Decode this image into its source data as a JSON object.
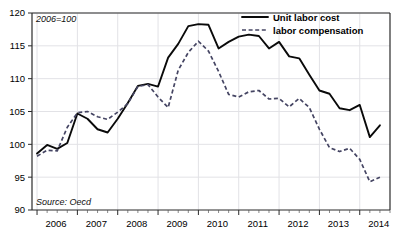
{
  "chart_data": {
    "type": "line",
    "title": "",
    "subtitle": "",
    "annotation_index": "2006=100",
    "source_note": "Source: Oecd",
    "xlabel": "",
    "ylabel": "",
    "ylim": [
      90,
      120
    ],
    "yticks": [
      90,
      95,
      100,
      105,
      110,
      115,
      120
    ],
    "ytick_labels": [
      "90",
      "95",
      "100",
      "105",
      "110",
      "115",
      "120"
    ],
    "xlim": [
      2005.875,
      2014.75
    ],
    "xticks": [
      2006,
      2007,
      2008,
      2009,
      2010,
      2011,
      2012,
      2013,
      2014
    ],
    "xtick_labels": [
      "2006",
      "2007",
      "2008",
      "2009",
      "2010",
      "2011",
      "2012",
      "2013",
      "2014"
    ],
    "minor_xticks_per_year": 4,
    "grid": true,
    "grid_axis": "both",
    "legend_position": "top-right",
    "x": [
      2006.0,
      2006.25,
      2006.5,
      2006.75,
      2007.0,
      2007.25,
      2007.5,
      2007.75,
      2008.0,
      2008.25,
      2008.5,
      2008.75,
      2009.0,
      2009.25,
      2009.5,
      2009.75,
      2010.0,
      2010.25,
      2010.5,
      2010.75,
      2011.0,
      2011.25,
      2011.5,
      2011.75,
      2012.0,
      2012.25,
      2012.5,
      2012.75,
      2013.0,
      2013.25,
      2013.5,
      2013.75,
      2014.0,
      2014.25,
      2014.5
    ],
    "series": [
      {
        "name": "Unit labor cost",
        "style": "solid",
        "color": "#0a0a0a",
        "values": [
          98.6,
          99.9,
          99.3,
          100.2,
          104.7,
          103.9,
          102.3,
          101.8,
          103.9,
          106.3,
          108.9,
          109.2,
          108.8,
          113.2,
          115.3,
          118.0,
          118.3,
          118.2,
          114.6,
          115.6,
          116.4,
          116.7,
          116.5,
          114.6,
          115.6,
          113.4,
          113.1,
          110.6,
          108.2,
          107.7,
          105.5,
          105.2,
          106.0,
          101.1,
          102.9
        ]
      },
      {
        "name": "labor compensation",
        "style": "dashed",
        "color": "#454563",
        "values": [
          98.2,
          99.1,
          99.0,
          102.6,
          104.8,
          105.0,
          104.2,
          103.8,
          104.9,
          106.2,
          108.8,
          109.1,
          107.2,
          105.6,
          111.3,
          114.0,
          115.7,
          114.2,
          111.1,
          107.6,
          107.2,
          108.0,
          108.2,
          106.9,
          107.0,
          105.7,
          107.0,
          105.6,
          102.3,
          99.5,
          98.9,
          99.4,
          97.7,
          94.3,
          95.0
        ]
      }
    ]
  },
  "legend": {
    "items": [
      {
        "label": "Unit labor cost",
        "style": "solid"
      },
      {
        "label": "labor compensation",
        "style": "dashed"
      }
    ]
  }
}
